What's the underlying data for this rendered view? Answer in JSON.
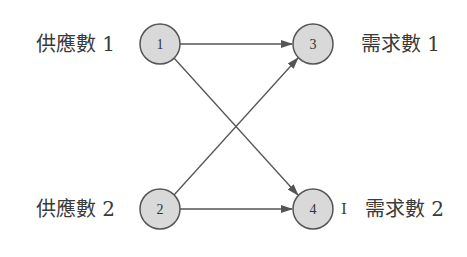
{
  "diagram": {
    "type": "network-flow",
    "colors": {
      "node_fill": "#d9d9d9",
      "node_stroke": "#555555",
      "edge": "#555555",
      "text": "#3a3a3a"
    },
    "nodes": [
      {
        "id": "1",
        "label": "1",
        "side_label": "供應數 1"
      },
      {
        "id": "2",
        "label": "2",
        "side_label": "供應數 2"
      },
      {
        "id": "3",
        "label": "3",
        "side_label": "需求數 1"
      },
      {
        "id": "4",
        "label": "4",
        "side_label": "需求數 2",
        "extra_mark": "I"
      }
    ],
    "edges": [
      {
        "from": "1",
        "to": "3"
      },
      {
        "from": "1",
        "to": "4"
      },
      {
        "from": "2",
        "to": "3"
      },
      {
        "from": "2",
        "to": "4"
      }
    ]
  }
}
